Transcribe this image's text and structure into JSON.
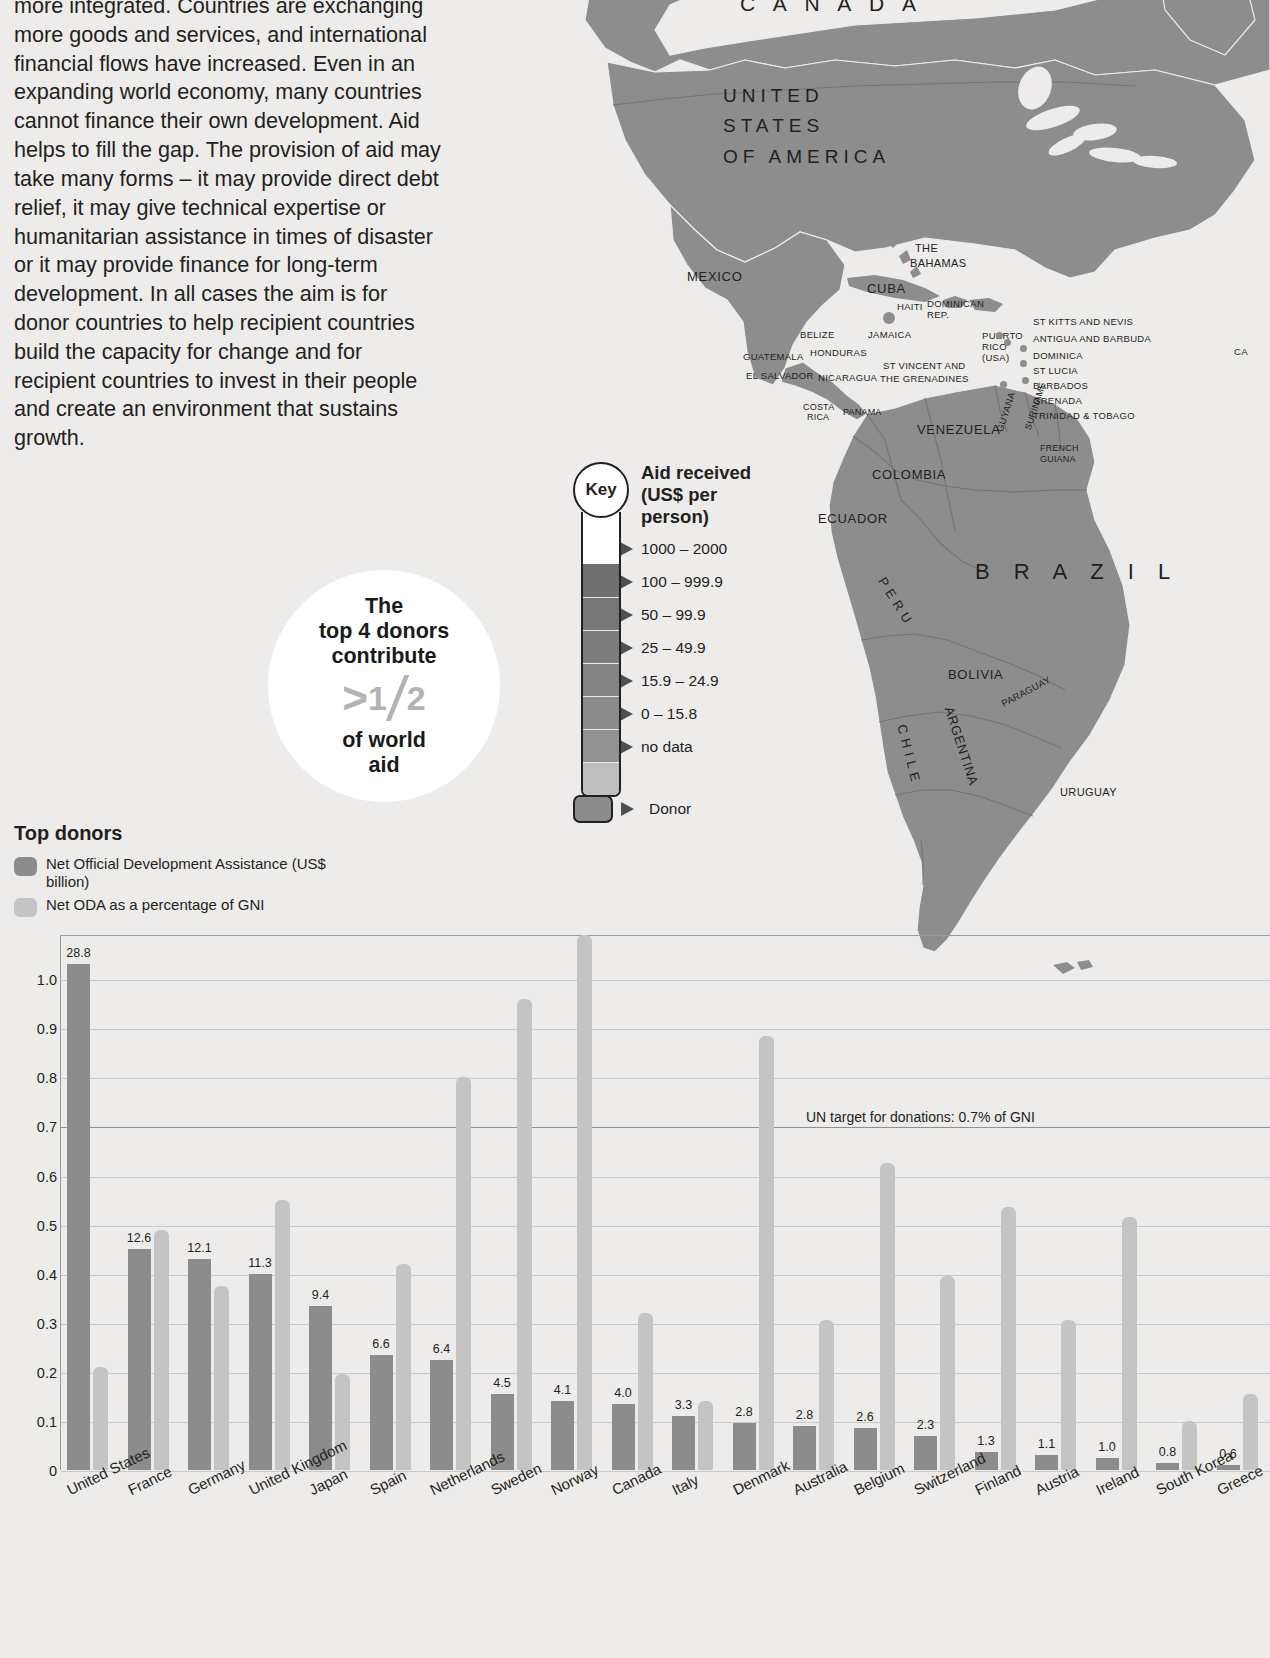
{
  "article": {
    "body": "more integrated. Countries are exchanging more goods and services, and international financial flows have increased. Even in an expanding world economy, many countries cannot finance their own development. Aid helps to fill the gap. The provision of aid may take many forms – it may provide direct debt relief, it may give technical expertise or humanitarian assistance in times of disaster or it may provide finance for long-term development. In all cases the aim is for donor countries to help recipient countries build the capacity for change and for recipient countries to invest in their people and create an environment that sustains growth."
  },
  "callout": {
    "line1": "The",
    "line2": "top 4 donors",
    "line3": "contribute",
    "fraction_prefix": ">",
    "fraction_numerator": "1",
    "fraction_denominator": "2",
    "line4": "of world",
    "line5": "aid"
  },
  "key": {
    "badge": "Key",
    "title_line1": "Aid received",
    "title_line2": "(US$ per",
    "title_line3": "person)",
    "bands": [
      {
        "label": "1000 – 2000",
        "color": "#6f6f6f"
      },
      {
        "label": "100 – 999.9",
        "color": "#767676"
      },
      {
        "label": "50 – 99.9",
        "color": "#7d7d7d"
      },
      {
        "label": "25 – 49.9",
        "color": "#848484"
      },
      {
        "label": "15.9 – 24.9",
        "color": "#8b8b8b"
      },
      {
        "label": "0 – 15.8",
        "color": "#929292"
      },
      {
        "label": "no data",
        "color": "#bfbfbf"
      }
    ],
    "donor_label": "Donor",
    "donor_color": "#8c8c8c"
  },
  "top_donors_legend": {
    "title": "Top donors",
    "items": [
      {
        "label": "Net Official Development Assistance (US$ billion)",
        "color": "#8c8c8c"
      },
      {
        "label": "Net ODA as a percentage of GNI",
        "color": "#c4c4c4"
      }
    ]
  },
  "chart_data": {
    "type": "bar",
    "title": "Top donors",
    "xlabel": "",
    "ylabel": "Donations as percentage of GNI",
    "ylim": [
      0,
      1.09
    ],
    "yticks": [
      "0",
      "0.1",
      "0.2",
      "0.3",
      "0.4",
      "0.5",
      "0.6",
      "0.7",
      "0.8",
      "0.9",
      "1.0"
    ],
    "ytick_values": [
      0,
      0.1,
      0.2,
      0.3,
      0.4,
      0.5,
      0.6,
      0.7,
      0.8,
      0.9,
      1.0
    ],
    "grid": true,
    "legend_position": "above-left",
    "annotation": "UN target for donations: 0.7% of GNI",
    "annotation_value": 0.7,
    "categories": [
      "United States",
      "France",
      "Germany",
      "United Kingdom",
      "Japan",
      "Spain",
      "Netherlands",
      "Sweden",
      "Norway",
      "Canada",
      "Italy",
      "Denmark",
      "Australia",
      "Belgium",
      "Switzerland",
      "Finland",
      "Austria",
      "Ireland",
      "South Korea",
      "Greece"
    ],
    "series": [
      {
        "name": "Net Official Development Assistance (US$ billion)",
        "color": "#8c8c8c",
        "labels": [
          "28.8",
          "12.6",
          "12.1",
          "11.3",
          "9.4",
          "6.6",
          "6.4",
          "4.5",
          "4.1",
          "4.0",
          "3.3",
          "2.8",
          "2.8",
          "2.6",
          "2.3",
          "1.3",
          "1.1",
          "1.0",
          "0.8",
          "0.6"
        ],
        "values": [
          28.8,
          12.6,
          12.1,
          11.3,
          9.4,
          6.6,
          6.4,
          4.5,
          4.1,
          4.0,
          3.3,
          2.8,
          2.8,
          2.6,
          2.3,
          1.3,
          1.1,
          1.0,
          0.8,
          0.6
        ],
        "plotted_heights": [
          1.03,
          0.45,
          0.43,
          0.4,
          0.335,
          0.235,
          0.225,
          0.155,
          0.14,
          0.135,
          0.11,
          0.095,
          0.09,
          0.085,
          0.07,
          0.037,
          0.03,
          0.025,
          0.015,
          0.01
        ]
      },
      {
        "name": "Net ODA as a percentage of GNI",
        "color": "#c4c4c4",
        "values": [
          0.21,
          0.49,
          0.375,
          0.55,
          0.195,
          0.42,
          0.8,
          0.96,
          1.09,
          0.32,
          0.14,
          0.885,
          0.305,
          0.625,
          0.395,
          0.535,
          0.305,
          0.515,
          0.1,
          0.155
        ]
      }
    ]
  },
  "map": {
    "labels": [
      {
        "text": "C A N A D A",
        "x": 285,
        "y": -8,
        "cls": "ml-huge"
      },
      {
        "text": "UNITED",
        "x": 268,
        "y": 85,
        "cls": "ml-big ml-c"
      },
      {
        "text": "STATES",
        "x": 268,
        "y": 115,
        "cls": "ml-big ml-c"
      },
      {
        "text": "OF AMERICA",
        "x": 268,
        "y": 146,
        "cls": "ml-big ml-c"
      },
      {
        "text": "MEXICO",
        "x": 232,
        "y": 270,
        "cls": "ml-med"
      },
      {
        "text": "THE",
        "x": 460,
        "y": 242,
        "cls": "ml-sm"
      },
      {
        "text": "BAHAMAS",
        "x": 455,
        "y": 257,
        "cls": "ml-sm"
      },
      {
        "text": "CUBA",
        "x": 412,
        "y": 282,
        "cls": "ml-med"
      },
      {
        "text": "HAITI",
        "x": 442,
        "y": 302,
        "cls": "ml-xs"
      },
      {
        "text": "DOMINICAN",
        "x": 472,
        "y": 299,
        "cls": "ml-xs"
      },
      {
        "text": "REP.",
        "x": 472,
        "y": 310,
        "cls": "ml-xs"
      },
      {
        "text": "JAMAICA",
        "x": 413,
        "y": 330,
        "cls": "ml-xs"
      },
      {
        "text": "BELIZE",
        "x": 345,
        "y": 330,
        "cls": "ml-xs"
      },
      {
        "text": "HONDURAS",
        "x": 355,
        "y": 348,
        "cls": "ml-xs"
      },
      {
        "text": "GUATEMALA",
        "x": 288,
        "y": 352,
        "cls": "ml-xs"
      },
      {
        "text": "EL SALVADOR",
        "x": 291,
        "y": 371,
        "cls": "ml-xs"
      },
      {
        "text": "NICARAGUA",
        "x": 363,
        "y": 373,
        "cls": "ml-xs"
      },
      {
        "text": "COSTA",
        "x": 348,
        "y": 402,
        "cls": "ml-tiny"
      },
      {
        "text": "RICA",
        "x": 352,
        "y": 412,
        "cls": "ml-tiny"
      },
      {
        "text": "PANAMA",
        "x": 388,
        "y": 407,
        "cls": "ml-tiny"
      },
      {
        "text": "PUERTO",
        "x": 527,
        "y": 331,
        "cls": "ml-xs"
      },
      {
        "text": "RICO",
        "x": 527,
        "y": 342,
        "cls": "ml-xs"
      },
      {
        "text": "(USA)",
        "x": 527,
        "y": 353,
        "cls": "ml-xs"
      },
      {
        "text": "ST KITTS AND NEVIS",
        "x": 578,
        "y": 317,
        "cls": "ml-xs"
      },
      {
        "text": "ANTIGUA AND BARBUDA",
        "x": 578,
        "y": 334,
        "cls": "ml-xs"
      },
      {
        "text": "DOMINICA",
        "x": 578,
        "y": 351,
        "cls": "ml-xs"
      },
      {
        "text": "ST LUCIA",
        "x": 578,
        "y": 366,
        "cls": "ml-xs"
      },
      {
        "text": "ST VINCENT AND",
        "x": 428,
        "y": 361,
        "cls": "ml-xs"
      },
      {
        "text": "THE GRENADINES",
        "x": 425,
        "y": 374,
        "cls": "ml-xs"
      },
      {
        "text": "BARBADOS",
        "x": 578,
        "y": 381,
        "cls": "ml-xs"
      },
      {
        "text": "GRENADA",
        "x": 578,
        "y": 396,
        "cls": "ml-xs"
      },
      {
        "text": "TRINIDAD & TOBAGO",
        "x": 578,
        "y": 411,
        "cls": "ml-xs"
      },
      {
        "text": "VENEZUELA",
        "x": 462,
        "y": 423,
        "cls": "ml-med"
      },
      {
        "text": "COLOMBIA",
        "x": 417,
        "y": 468,
        "cls": "ml-med"
      },
      {
        "text": "ECUADOR",
        "x": 363,
        "y": 512,
        "cls": "ml-med"
      },
      {
        "text": "B R A Z I L",
        "x": 520,
        "y": 560,
        "cls": "ml-brazil"
      },
      {
        "text": "BOLIVIA",
        "x": 493,
        "y": 668,
        "cls": "ml-med"
      },
      {
        "text": "URUGUAY",
        "x": 605,
        "y": 786,
        "cls": "ml-sm"
      },
      {
        "text": "CA",
        "x": 779,
        "y": 347,
        "cls": "ml-xs"
      }
    ],
    "rotated_labels": [
      {
        "text": "GUYANA",
        "x": 540,
        "y": 430,
        "rot": -72,
        "cls": "ml-xs"
      },
      {
        "text": "SURINAME",
        "x": 568,
        "y": 428,
        "rot": -72,
        "cls": "ml-tiny"
      },
      {
        "text": "FRENCH",
        "x": 585,
        "y": 443,
        "rot": 0,
        "cls": "ml-tiny"
      },
      {
        "text": "GUIANA",
        "x": 585,
        "y": 454,
        "rot": 0,
        "cls": "ml-tiny"
      },
      {
        "text": "P E R U",
        "x": 432,
        "y": 575,
        "rot": 58,
        "cls": "ml-med"
      },
      {
        "text": "PARAGUAY",
        "x": 545,
        "y": 700,
        "rot": -28,
        "cls": "ml-xs"
      },
      {
        "text": "C H I L E",
        "x": 453,
        "y": 723,
        "rot": 76,
        "cls": "ml-med"
      },
      {
        "text": "ARGENTINA",
        "x": 500,
        "y": 705,
        "rot": 72,
        "cls": "ml-med"
      }
    ],
    "island_dots": [
      {
        "x": 541,
        "y": 332
      },
      {
        "x": 549,
        "y": 339
      },
      {
        "x": 565,
        "y": 345
      },
      {
        "x": 565,
        "y": 360
      },
      {
        "x": 567,
        "y": 377
      },
      {
        "x": 545,
        "y": 381
      },
      {
        "x": 563,
        "y": 394
      },
      {
        "x": 560,
        "y": 410
      }
    ]
  }
}
